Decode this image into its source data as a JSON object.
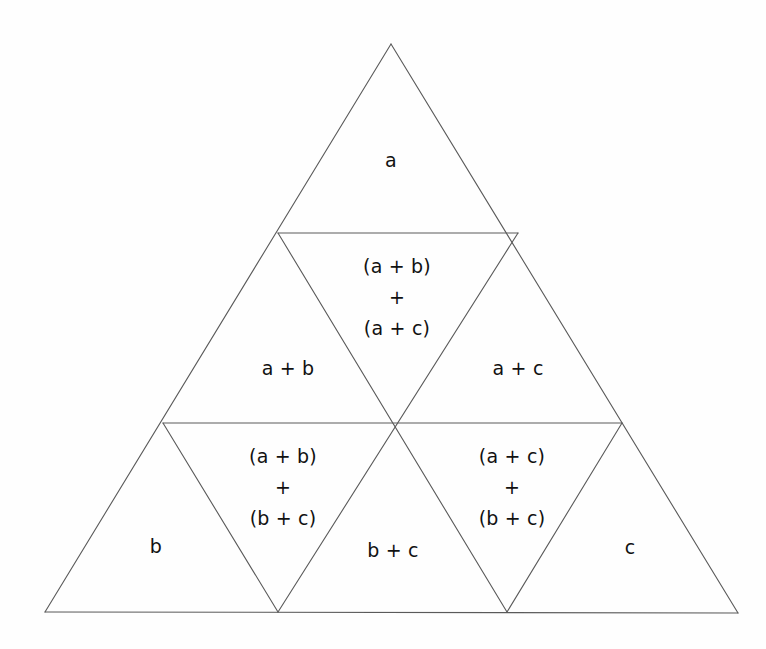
{
  "figure": {
    "background_color": "#fefefe",
    "stroke_color": "#5a5a5a",
    "text_color": "#111111",
    "stroke_width": 1.1,
    "outer_triangle": {
      "apex": [
        391,
        44
      ],
      "bottom_left": [
        45,
        612
      ],
      "bottom_right": [
        738,
        613
      ]
    },
    "internal_lines": [
      {
        "name": "upper-horizontal",
        "from": [
          278,
          233
        ],
        "to": [
          518,
          233
        ]
      },
      {
        "name": "lower-horizontal",
        "from": [
          163,
          423
        ],
        "to": [
          622,
          423
        ]
      },
      {
        "name": "left-diagonal-up",
        "from": [
          278,
          233
        ],
        "to": [
          507,
          612
        ]
      },
      {
        "name": "right-diagonal-up",
        "from": [
          518,
          233
        ],
        "to": [
          278,
          612
        ]
      },
      {
        "name": "left-lower-diagonal",
        "from": [
          163,
          423
        ],
        "to": [
          278,
          612
        ]
      },
      {
        "name": "right-lower-diagonal",
        "from": [
          622,
          423
        ],
        "to": [
          507,
          612
        ]
      }
    ],
    "center_junction": [
      392,
      424
    ]
  },
  "cells": [
    {
      "id": "top",
      "name": "cell-a",
      "lines": [
        "a"
      ],
      "x": 391,
      "y": 160
    },
    {
      "id": "upper-inverted",
      "name": "cell-ab-plus-ac",
      "lines": [
        "(a + b)",
        "+",
        "(a + c)"
      ],
      "x": 397,
      "y": 297
    },
    {
      "id": "mid-left",
      "name": "cell-a-plus-b",
      "lines": [
        "a + b"
      ],
      "x": 288,
      "y": 368
    },
    {
      "id": "mid-right",
      "name": "cell-a-plus-c",
      "lines": [
        "a + c"
      ],
      "x": 518,
      "y": 368
    },
    {
      "id": "lower-left-inverted",
      "name": "cell-ab-plus-bc",
      "lines": [
        "(a + b)",
        "+",
        "(b + c)"
      ],
      "x": 283,
      "y": 487
    },
    {
      "id": "lower-right-inverted",
      "name": "cell-ac-plus-bc",
      "lines": [
        "(a + c)",
        "+",
        "(b + c)"
      ],
      "x": 512,
      "y": 487
    },
    {
      "id": "bottom-left",
      "name": "cell-b",
      "lines": [
        "b"
      ],
      "x": 156,
      "y": 546
    },
    {
      "id": "bottom-middle",
      "name": "cell-b-plus-c",
      "lines": [
        "b + c"
      ],
      "x": 393,
      "y": 550
    },
    {
      "id": "bottom-right",
      "name": "cell-c",
      "lines": [
        "c"
      ],
      "x": 630,
      "y": 547
    }
  ]
}
